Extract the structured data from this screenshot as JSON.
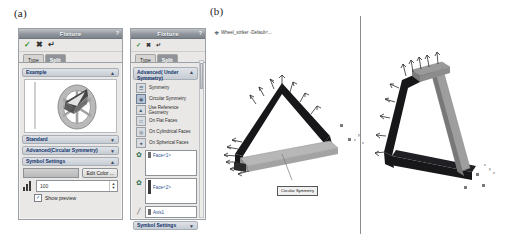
{
  "figure": {
    "panel_a_label": "(a)",
    "panel_b_label": "(b)"
  },
  "panel_a": {
    "dialog_1": {
      "title": "Fixture",
      "help_icon": "question-mark-icon",
      "toolbar": {
        "ok_icon": "check-icon",
        "ok_label": "✓",
        "cancel_icon": "cross-icon",
        "cancel_label": "✖",
        "preview_icon": "arrow-icon",
        "preview_label": "↵"
      },
      "tabs": [
        {
          "label": "Type",
          "active": false
        },
        {
          "label": "Split",
          "active": true
        }
      ],
      "sections": {
        "example": {
          "label": "Example",
          "chevron": "▲"
        },
        "standard": {
          "label": "Standard",
          "chevron": "▼"
        },
        "advanced": {
          "label": "Advanced(Circular Symmetry)",
          "chevron": "▼"
        },
        "symbol_settings": {
          "label": "Symbol Settings",
          "chevron": "▲"
        }
      },
      "edit_color_button": "Edit Color ...",
      "size_value": "100",
      "spin_up": "▲",
      "spin_down": "▼",
      "show_preview": {
        "label": "Show preview",
        "checked": true,
        "check_glyph": "✓"
      },
      "colors": {
        "titlebar_from": "#bfc3c7",
        "titlebar_to": "#7d848b",
        "section_text": "#10316b",
        "ok_green": "#2f8f2f"
      }
    },
    "dialog_2": {
      "title": "Fixture",
      "help_icon": "question-mark-icon",
      "toolbar": {
        "ok_label": "✓",
        "cancel_label": "✖",
        "preview_label": "↵"
      },
      "tabs": [
        {
          "label": "Type",
          "active": false
        },
        {
          "label": "Split",
          "active": true
        }
      ],
      "advanced_section": {
        "label": "Advanced( Under Symmetry)",
        "chevron": "▲"
      },
      "type_items": [
        {
          "label": "Symmetry",
          "icon": "symmetry-icon"
        },
        {
          "label": "Circular Symmetry",
          "icon": "circular-symmetry-icon",
          "selected": true
        },
        {
          "label": "Use Reference Geometry",
          "icon": "reference-geometry-icon"
        },
        {
          "label": "On Flat Faces",
          "icon": "flat-face-icon"
        },
        {
          "label": "On Cylindrical Faces",
          "icon": "cylindrical-face-icon"
        },
        {
          "label": "On Spherical Faces",
          "icon": "spherical-face-icon"
        }
      ],
      "selections": [
        {
          "icon": "face-selection-icon",
          "value": "Face<1>"
        },
        {
          "icon": "face-selection-icon",
          "value": "Face<2>"
        },
        {
          "icon": "axis-selection-icon",
          "value": "Axis1"
        }
      ],
      "symbol_settings_label": "Symbol Settings",
      "symbol_settings_chevron": "▼",
      "scrollbar": "vertical-scrollbar"
    }
  },
  "panel_b": {
    "tree_item": {
      "label": "Wheel_striker -Default<...",
      "icon": "part-icon",
      "expander": "⊕"
    },
    "callout": {
      "label": "Circular Symmetry"
    },
    "views": [
      {
        "name": "isometric-view-left",
        "model": "Wheel striker bracket"
      },
      {
        "name": "isometric-view-right",
        "model": "Wheel striker bracket"
      }
    ],
    "triad_left": "x y z",
    "triad_right": "x y z"
  }
}
